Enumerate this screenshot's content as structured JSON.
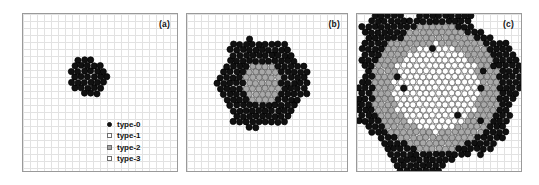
{
  "figure": {
    "background": "#ffffff",
    "grid_color": "#d9d9d9",
    "border_color": "#9a9a9a"
  },
  "legend": {
    "items": [
      {
        "label": "type-0",
        "marker": "filled-circle",
        "color": "#111111"
      },
      {
        "label": "type-1",
        "marker": "open-square",
        "color": "#ffffff"
      },
      {
        "label": "type-2",
        "marker": "gray-square",
        "color": "#a8a8a8"
      },
      {
        "label": "type-3",
        "marker": "open-square",
        "color": "#ffffff"
      }
    ]
  },
  "panels": [
    {
      "label": "(a)",
      "name": "panel-a"
    },
    {
      "label": "(b)",
      "name": "panel-b"
    },
    {
      "label": "(c)",
      "name": "panel-c"
    }
  ],
  "chart_data": {
    "type": "scatter",
    "title": "",
    "xlabel": "",
    "ylabel": "",
    "grid": true,
    "legend_position": "inside-lower-right-panel-a",
    "marker_radius_px": 3.1,
    "lattice": "hexagonal-close-packed",
    "lattice_spacing_px": 6.4,
    "series": [
      {
        "name": "type-0",
        "fill": "#111111",
        "stroke": "#000000"
      },
      {
        "name": "type-1",
        "fill": "#ffffff",
        "stroke": "#555555"
      },
      {
        "name": "type-2",
        "fill": "#a8a8a8",
        "stroke": "#555555"
      },
      {
        "name": "type-3",
        "fill": "#ffffff",
        "stroke": "#555555"
      }
    ],
    "panels": [
      {
        "label": "(a)",
        "center": [
          0.42,
          0.4
        ],
        "radius_rings": 3,
        "n_particles": 31,
        "composition": {
          "type-0": 31,
          "type-1": 0,
          "type-2": 0,
          "type-3": 0
        },
        "shells": [
          {
            "from": 0,
            "to": 3,
            "type": "type-0"
          }
        ],
        "roughness": 0.3
      },
      {
        "label": "(b)",
        "center": [
          0.47,
          0.44
        ],
        "radius_rings": 7,
        "n_particles": 155,
        "composition": {
          "type-0": 108,
          "type-1": 6,
          "type-2": 41,
          "type-3": 0
        },
        "shells": [
          {
            "from": 0,
            "to": 3,
            "type": "type-2"
          },
          {
            "from": 3,
            "to": 7,
            "type": "type-0"
          }
        ],
        "roughness": 0.42
      },
      {
        "label": "(c)",
        "center": [
          0.48,
          0.47
        ],
        "radius_rings": 13,
        "n_particles": 470,
        "composition": {
          "type-0": 150,
          "type-1": 180,
          "type-2": 132,
          "type-3": 8
        },
        "shells": [
          {
            "from": 0,
            "to": 7,
            "type": "type-1"
          },
          {
            "from": 7,
            "to": 10,
            "type": "type-2"
          },
          {
            "from": 10,
            "to": 13,
            "type": "type-0"
          }
        ],
        "roughness": 0.55
      }
    ]
  }
}
